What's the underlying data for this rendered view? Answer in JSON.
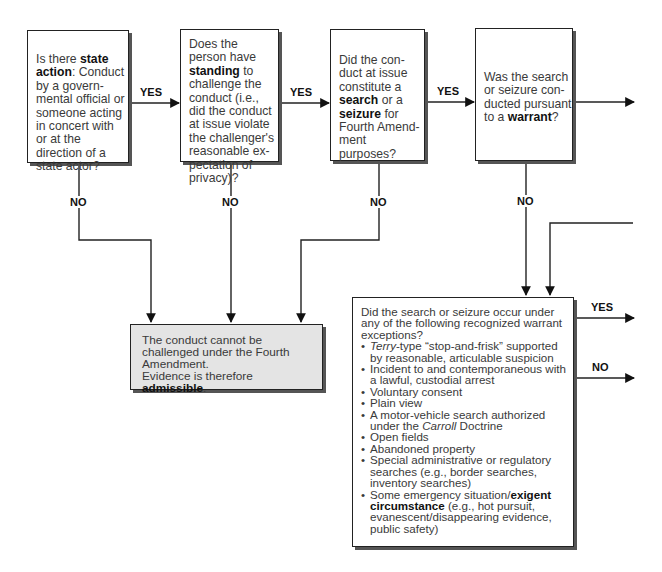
{
  "nodes": {
    "state_action": {
      "pre": "Is there ",
      "bold": "state action",
      "post": ": Conduct by a govern-mental official or someone acting in concert with or at the direction of a state actor?"
    },
    "standing": {
      "pre": "Does the person have ",
      "bold": "standing",
      "post": " to challenge the conduct (i.e., did the conduct at issue violate the challenger's reasonable ex-pectation of privacy)?"
    },
    "search_seizure": {
      "pre": "Did the con-duct at issue constitute a ",
      "bold1": "search",
      "mid": " or a ",
      "bold2": "seizure",
      "post": " for Fourth Amend-ment purposes?"
    },
    "warrant": {
      "pre": "Was the search or seizure con-ducted pursuant to a ",
      "bold": "warrant",
      "post": "?"
    },
    "admissible": {
      "line1": "The conduct cannot be challenged under the Fourth Amendment.",
      "pre": "Evidence is therefore ",
      "bold": "admissible",
      "post": "."
    },
    "exceptions": {
      "question": "Did the search or seizure occur under any of the following recognized warrant exceptions?",
      "items": {
        "terry_italic": "Terry",
        "terry_rest": "-type “stop-and-frisk” supported by reasonable, articulable suspicion",
        "arrest": "Incident to and contemporaneous with a lawful, custodial arrest",
        "consent": "Voluntary consent",
        "plain_view": "Plain view",
        "carroll_pre": "A motor-vehicle search authorized under the ",
        "carroll_italic": "Carroll",
        "carroll_post": " Doctrine",
        "open_fields": "Open fields",
        "abandoned": "Abandoned property",
        "special": "Special administrative or regulatory searches (e.g., border searches, inventory searches)",
        "exigent_pre": "Some emergency situation/",
        "exigent_bold": "exigent circumstance",
        "exigent_post": " (e.g., hot pursuit, evanescent/disappearing evidence, public safety)"
      }
    }
  },
  "edge_labels": {
    "yes": "YES",
    "no": "NO"
  }
}
